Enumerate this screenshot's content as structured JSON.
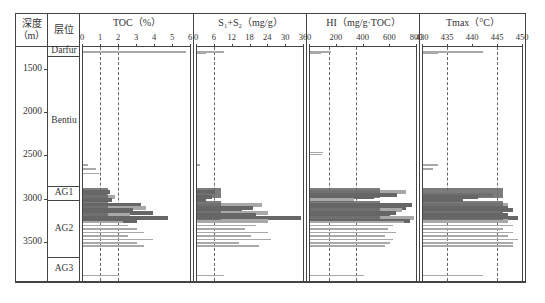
{
  "header": {
    "depth_label": "深度",
    "depth_unit": "（m）",
    "layer_label": "层位"
  },
  "panels": [
    {
      "title": "TOC（%）",
      "ticks": [
        "0",
        "1",
        "2",
        "3",
        "4",
        "5",
        "6"
      ],
      "min": 0,
      "max": 6,
      "dashed": [
        1,
        2
      ]
    },
    {
      "title": "S₁+S₂（mg/g）",
      "ticks": [
        "0",
        "6",
        "12",
        "18",
        "24",
        "30",
        "36"
      ],
      "min": 0,
      "max": 36,
      "dashed": [
        6
      ]
    },
    {
      "title": "HI（mg/g·TOC）",
      "ticks": [
        "0",
        "200",
        "400",
        "600",
        "800"
      ],
      "min": 0,
      "max": 800,
      "dashed": [
        150,
        350
      ]
    },
    {
      "title": "Tmax（°C）",
      "ticks": [
        "430",
        "435",
        "440",
        "445",
        "450"
      ],
      "min": 430,
      "max": 450,
      "dashed": [
        435,
        445
      ]
    }
  ],
  "depth_ticks": [
    "1500",
    "2000",
    "2500",
    "3000",
    "3500"
  ],
  "layers": [
    "Darfur",
    "Bentiu",
    "AG1",
    "AG2",
    "AG3"
  ],
  "colors": {
    "bar_dark": "#666666",
    "bar_light": "#a8a8a8",
    "axis": "#444444"
  },
  "chart_data": {
    "type": "bar",
    "ylabel": "深度（m）",
    "ylim": [
      1250,
      3950
    ],
    "depth_axis_ticks": [
      1500,
      2000,
      2500,
      3000,
      3500
    ],
    "layers": [
      {
        "name": "Darfur",
        "top": 1250,
        "bottom": 1350
      },
      {
        "name": "Bentiu",
        "top": 1350,
        "bottom": 2850
      },
      {
        "name": "AG1",
        "top": 2850,
        "bottom": 3020
      },
      {
        "name": "AG2",
        "top": 3020,
        "bottom": 3670
      },
      {
        "name": "AG3",
        "top": 3670,
        "bottom": 3950
      }
    ],
    "series": [
      {
        "name": "TOC (%)",
        "xlim": [
          0,
          6
        ],
        "reference_lines": [
          1,
          2
        ],
        "depth": [
          1300,
          1305,
          2600,
          2650,
          2700,
          2900,
          2930,
          2960,
          2990,
          3050,
          3080,
          3110,
          3140,
          3170,
          3200,
          3230,
          3260,
          3300,
          3340,
          3380,
          3420,
          3460,
          3500,
          3540,
          3880
        ],
        "values": [
          5.7,
          3.0,
          0.3,
          0.7,
          0.9,
          1.5,
          1.3,
          1.8,
          1.6,
          3.2,
          3.5,
          2.8,
          3.9,
          2.6,
          4.7,
          3.0,
          2.2,
          2.5,
          3.0,
          3.4,
          2.5,
          3.9,
          3.0,
          3.4,
          2.0
        ]
      },
      {
        "name": "S1+S2 (mg/g)",
        "xlim": [
          0,
          36
        ],
        "reference_lines": [
          6
        ],
        "depth": [
          1300,
          1310,
          2600,
          2900,
          2930,
          2960,
          2990,
          3050,
          3080,
          3110,
          3140,
          3170,
          3200,
          3230,
          3260,
          3300,
          3340,
          3380,
          3420,
          3460,
          3500,
          3540,
          3880
        ],
        "values": [
          9,
          3,
          1,
          6,
          4,
          5,
          3,
          22,
          19,
          15,
          24,
          20,
          35,
          24,
          13,
          20,
          16,
          24,
          18,
          25,
          14,
          21,
          9
        ]
      },
      {
        "name": "HI (mg/g·TOC)",
        "xlim": [
          0,
          800
        ],
        "reference_lines": [
          150,
          350
        ],
        "depth": [
          1300,
          1310,
          2460,
          2480,
          2900,
          2930,
          2960,
          2990,
          3050,
          3080,
          3110,
          3140,
          3170,
          3200,
          3230,
          3260,
          3300,
          3340,
          3380,
          3420,
          3460,
          3500,
          3540,
          3880
        ],
        "values": [
          160,
          80,
          100,
          90,
          720,
          650,
          480,
          330,
          760,
          720,
          690,
          640,
          600,
          780,
          750,
          700,
          620,
          580,
          640,
          560,
          620,
          600,
          560,
          400
        ]
      },
      {
        "name": "Tmax (°C)",
        "xlim": [
          430,
          450
        ],
        "reference_lines": [
          435,
          445
        ],
        "depth": [
          1300,
          1310,
          2600,
          2650,
          2930,
          2960,
          2990,
          3050,
          3080,
          3110,
          3140,
          3170,
          3200,
          3230,
          3260,
          3300,
          3340,
          3380,
          3420,
          3460,
          3500,
          3540,
          3880
        ],
        "values": [
          442,
          433,
          433,
          432,
          444,
          441,
          438,
          447,
          447,
          448,
          446,
          447,
          449,
          447,
          445,
          448,
          446,
          448,
          447,
          449,
          448,
          448,
          442
        ]
      }
    ]
  }
}
